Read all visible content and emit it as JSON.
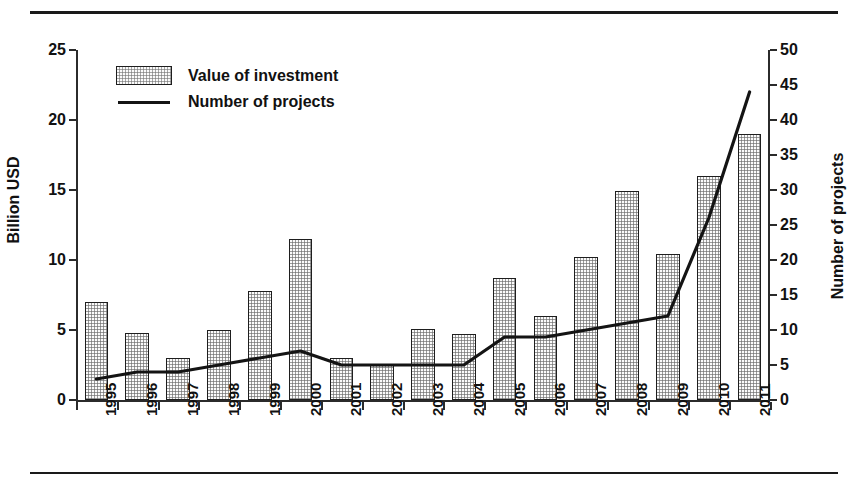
{
  "figure": {
    "title_fragment": "",
    "top_rule": "horizontal-rule",
    "bottom_rule": "horizontal-rule"
  },
  "legend": {
    "position": "top-left-inside",
    "items": [
      {
        "label": "Value of investment",
        "marker": "filled-bar-swatch"
      },
      {
        "label": "Number of projects",
        "marker": "line-swatch"
      }
    ]
  },
  "chart_data": {
    "type": "bar",
    "title": "",
    "subtitle": "",
    "categories": [
      "1995",
      "1996",
      "1997",
      "1998",
      "1999",
      "2000",
      "2001",
      "2002",
      "2003",
      "2004",
      "2005",
      "2006",
      "2007",
      "2008",
      "2009",
      "2010",
      "2011"
    ],
    "xlabel": "",
    "ylabel": "Billion USD",
    "y2label": "Number of projects",
    "ylim": [
      0,
      25
    ],
    "y2lim": [
      0,
      50
    ],
    "yticks": [
      0,
      5,
      10,
      15,
      20,
      25
    ],
    "y2ticks": [
      0,
      5,
      10,
      15,
      20,
      25,
      30,
      35,
      40,
      45,
      50
    ],
    "grid": false,
    "legend_position": "upper left",
    "xtick_rotation": 90,
    "series": [
      {
        "name": "Value of investment",
        "type": "bar",
        "axis": "left",
        "unit": "Billion USD",
        "values": [
          7.0,
          4.8,
          3.0,
          5.0,
          7.8,
          11.5,
          3.0,
          2.6,
          5.1,
          4.7,
          8.7,
          6.0,
          10.2,
          14.9,
          10.4,
          16.0,
          19.0
        ]
      },
      {
        "name": "Number of projects",
        "type": "line",
        "axis": "right",
        "unit": "projects",
        "values": [
          3,
          4,
          4,
          5,
          6,
          7,
          5,
          5,
          5,
          5,
          9,
          9,
          10,
          11,
          12,
          26,
          44
        ]
      }
    ]
  }
}
